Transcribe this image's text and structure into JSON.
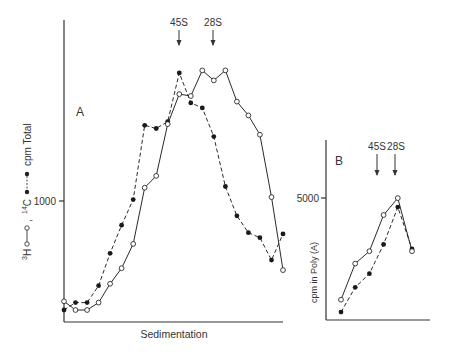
{
  "chart_data": [
    {
      "panel": "A",
      "type": "line",
      "title": "",
      "panel_label": "A",
      "xlabel": "Sedimentation",
      "ylabel": "3H o—o , 14C •----• cpm Total",
      "ylabel_parts": {
        "h3": "H",
        "h3_sup": "3",
        "c14": "C",
        "c14_sup": "14",
        "sep": ",",
        "suffix": "cpm Total"
      },
      "y_ticks": [
        {
          "value": 1000,
          "label": "1000"
        }
      ],
      "annotations": [
        {
          "label": "45S",
          "x_index": 10
        },
        {
          "label": "28S",
          "x_index": 12
        }
      ],
      "grid": false,
      "x": [
        1,
        2,
        3,
        4,
        5,
        6,
        7,
        8,
        9,
        10,
        11,
        12,
        13,
        14,
        15,
        16,
        17,
        18,
        19,
        20
      ],
      "series": [
        {
          "name": "3H (open circles, solid)",
          "marker": "open-circle",
          "line": "solid",
          "values": [
            310,
            240,
            240,
            300,
            450,
            575,
            770,
            1220,
            1315,
            1730,
            1970,
            1955,
            2160,
            2080,
            2160,
            1910,
            1800,
            1645,
            1145,
            560
          ]
        },
        {
          "name": "14C (filled circles, dashed)",
          "marker": "filled-circle",
          "line": "dashed",
          "values": [
            240,
            300,
            300,
            435,
            695,
            920,
            1125,
            1720,
            1695,
            1750,
            2140,
            1900,
            1860,
            1630,
            1230,
            995,
            860,
            820,
            640,
            850
          ]
        }
      ],
      "ylim": [
        0,
        2500
      ]
    },
    {
      "panel": "B",
      "type": "line",
      "panel_label": "B",
      "xlabel": "",
      "ylabel": "cpm in Poly (A)",
      "y_ticks": [
        {
          "value": 5000,
          "label": "5000"
        }
      ],
      "annotations": [
        {
          "label": "45S",
          "x_index": 3
        },
        {
          "label": "28S",
          "x_index": 5
        }
      ],
      "grid": false,
      "x": [
        1,
        2,
        3,
        4,
        5,
        6
      ],
      "series": [
        {
          "name": "3H (open circles, solid)",
          "marker": "open-circle",
          "line": "solid",
          "values": [
            900,
            2500,
            3050,
            4650,
            5400,
            3050
          ]
        },
        {
          "name": "14C (filled circles, dashed)",
          "marker": "filled-circle",
          "line": "dashed",
          "values": [
            350,
            1450,
            2050,
            3350,
            5000,
            3150
          ]
        }
      ],
      "ylim": [
        0,
        7000
      ]
    }
  ],
  "panelA": {
    "label": "A",
    "xlabel": "Sedimentation",
    "tick_1000": "1000",
    "marker_45s": "45S",
    "marker_28s": "28S",
    "ylabel_h": "H",
    "ylabel_h_sup": "3",
    "ylabel_c": "C",
    "ylabel_c_sup": "14",
    "ylabel_comma": ",",
    "ylabel_suffix": "cpm Total"
  },
  "panelB": {
    "label": "B",
    "tick_5000": "5000",
    "marker_45s": "45S",
    "marker_28s": "28S",
    "ylabel": "cpm in Poly (A)"
  },
  "colors": {
    "ink": "#222222",
    "background": "#ffffff"
  }
}
